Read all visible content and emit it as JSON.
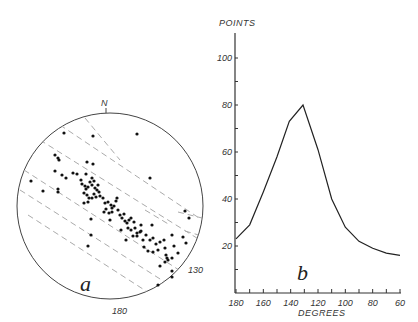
{
  "panel_a": {
    "label": "a",
    "north_label": "N",
    "label_130": "130",
    "label_180": "180",
    "center": [
      110,
      206
    ],
    "radius": 93,
    "dashed_lines": [
      [
        [
          24,
          170
        ],
        [
          196,
          281
        ]
      ],
      [
        [
          20,
          190
        ],
        [
          190,
          298
        ]
      ],
      [
        [
          28,
          215
        ],
        [
          160,
          300
        ]
      ],
      [
        [
          40,
          140
        ],
        [
          200,
          240
        ]
      ],
      [
        [
          60,
          125
        ],
        [
          202,
          220
        ]
      ],
      [
        [
          85,
          118
        ],
        [
          120,
          160
        ]
      ],
      [
        [
          145,
          210
        ],
        [
          170,
          225
        ]
      ],
      [
        [
          178,
          212
        ],
        [
          202,
          218
        ]
      ],
      [
        [
          185,
          231
        ],
        [
          202,
          236
        ]
      ]
    ],
    "dots": [
      [
        64,
        133
      ],
      [
        93,
        136
      ],
      [
        137,
        134
      ],
      [
        55,
        155
      ],
      [
        58,
        158
      ],
      [
        59,
        160
      ],
      [
        87,
        162
      ],
      [
        93,
        164
      ],
      [
        55,
        171
      ],
      [
        62,
        175
      ],
      [
        66,
        178
      ],
      [
        73,
        173
      ],
      [
        77,
        174
      ],
      [
        86,
        174
      ],
      [
        92,
        178
      ],
      [
        31,
        181
      ],
      [
        43,
        191
      ],
      [
        58,
        189
      ],
      [
        58,
        192
      ],
      [
        150,
        178
      ],
      [
        81,
        180
      ],
      [
        82,
        184
      ],
      [
        85,
        186
      ],
      [
        86,
        189
      ],
      [
        88,
        187
      ],
      [
        90,
        182
      ],
      [
        92,
        185
      ],
      [
        94,
        181
      ],
      [
        95,
        188
      ],
      [
        97,
        190
      ],
      [
        99,
        192
      ],
      [
        98,
        185
      ],
      [
        84,
        193
      ],
      [
        87,
        195
      ],
      [
        89,
        198
      ],
      [
        92,
        198
      ],
      [
        94,
        194
      ],
      [
        96,
        197
      ],
      [
        88,
        202
      ],
      [
        84,
        203
      ],
      [
        100,
        196
      ],
      [
        103,
        198
      ],
      [
        105,
        203
      ],
      [
        106,
        209
      ],
      [
        108,
        202
      ],
      [
        111,
        205
      ],
      [
        112,
        208
      ],
      [
        114,
        206
      ],
      [
        116,
        201
      ],
      [
        117,
        198
      ],
      [
        118,
        210
      ],
      [
        104,
        212
      ],
      [
        109,
        213
      ],
      [
        112,
        212
      ],
      [
        110,
        220
      ],
      [
        120,
        215
      ],
      [
        122,
        218
      ],
      [
        124,
        214
      ],
      [
        125,
        221
      ],
      [
        127,
        223
      ],
      [
        129,
        220
      ],
      [
        131,
        218
      ],
      [
        134,
        222
      ],
      [
        128,
        228
      ],
      [
        131,
        230
      ],
      [
        135,
        228
      ],
      [
        137,
        233
      ],
      [
        140,
        232
      ],
      [
        133,
        236
      ],
      [
        137,
        236
      ],
      [
        141,
        231
      ],
      [
        146,
        235
      ],
      [
        143,
        240
      ],
      [
        150,
        240
      ],
      [
        153,
        238
      ],
      [
        156,
        244
      ],
      [
        160,
        242
      ],
      [
        164,
        240
      ],
      [
        158,
        250
      ],
      [
        165,
        248
      ],
      [
        166,
        255
      ],
      [
        172,
        235
      ],
      [
        174,
        246
      ],
      [
        178,
        253
      ],
      [
        172,
        271
      ],
      [
        168,
        260
      ],
      [
        165,
        262
      ],
      [
        167,
        258
      ],
      [
        172,
        258
      ],
      [
        183,
        237
      ],
      [
        186,
        243
      ],
      [
        91,
        219
      ],
      [
        91,
        235
      ],
      [
        88,
        246
      ],
      [
        121,
        230
      ],
      [
        126,
        240
      ],
      [
        141,
        225
      ],
      [
        152,
        225
      ],
      [
        144,
        247
      ],
      [
        148,
        251
      ],
      [
        153,
        252
      ],
      [
        160,
        266
      ],
      [
        172,
        277
      ],
      [
        158,
        285
      ],
      [
        185,
        211
      ],
      [
        189,
        218
      ]
    ]
  },
  "panel_b": {
    "label": "b"
  },
  "chart_data": {
    "type": "line",
    "title": "",
    "xlabel": "DEGREES",
    "ylabel": "POINTS",
    "x": [
      180,
      170,
      160,
      150,
      141,
      131,
      120,
      110,
      100,
      90,
      80,
      70,
      60
    ],
    "values": [
      23,
      29,
      43,
      58,
      73,
      80,
      61,
      40,
      28,
      22,
      19,
      17,
      16
    ],
    "x_ticks": [
      180,
      160,
      140,
      120,
      100,
      80,
      60
    ],
    "y_ticks": [
      20,
      40,
      60,
      80,
      100
    ],
    "xlim": [
      180,
      60
    ],
    "ylim": [
      0,
      112
    ],
    "grid": false,
    "legend": null
  }
}
